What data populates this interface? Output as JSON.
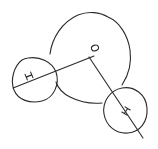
{
  "diagram": {
    "atoms": [
      {
        "id": "oxygen",
        "label": "O"
      },
      {
        "id": "hydrogen-left",
        "label": "H"
      },
      {
        "id": "hydrogen-right",
        "label": "H"
      }
    ],
    "bonds": [
      {
        "from": "oxygen",
        "to": "hydrogen-left"
      },
      {
        "from": "oxygen",
        "to": "hydrogen-right"
      }
    ],
    "colors": {
      "ink": "#2a2a2a",
      "background": "#ffffff"
    }
  }
}
